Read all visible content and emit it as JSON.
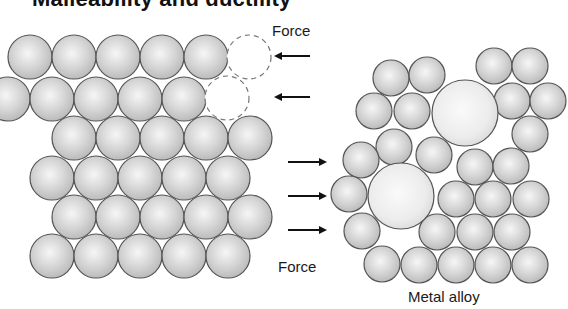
{
  "title": "Malleability and ductility",
  "labels": {
    "force_top": "Force",
    "force_bottom": "Force",
    "metal_alloy": "Metal  alloy"
  },
  "colors": {
    "sphere_outline": "#555555",
    "sphere_light": "#f4f4f4",
    "sphere_dark": "#b8b8b8",
    "arrow": "#111111"
  },
  "pure_metal": {
    "radius": 22,
    "atoms": [
      [
        30,
        57
      ],
      [
        74,
        57
      ],
      [
        118,
        57
      ],
      [
        162,
        57
      ],
      [
        206,
        57
      ],
      [
        8,
        99
      ],
      [
        52,
        99
      ],
      [
        96,
        99
      ],
      [
        140,
        99
      ],
      [
        184,
        99
      ],
      [
        74,
        138
      ],
      [
        118,
        138
      ],
      [
        162,
        138
      ],
      [
        206,
        138
      ],
      [
        250,
        138
      ],
      [
        52,
        178
      ],
      [
        96,
        178
      ],
      [
        140,
        178
      ],
      [
        184,
        178
      ],
      [
        228,
        178
      ],
      [
        74,
        217
      ],
      [
        118,
        217
      ],
      [
        162,
        217
      ],
      [
        206,
        217
      ],
      [
        250,
        217
      ],
      [
        52,
        256
      ],
      [
        96,
        256
      ],
      [
        140,
        256
      ],
      [
        184,
        256
      ],
      [
        228,
        256
      ]
    ],
    "displaced_atoms": [
      [
        249,
        57
      ],
      [
        227,
        98
      ]
    ]
  },
  "arrows": {
    "left": [
      [
        310,
        56,
        276
      ],
      [
        310,
        97,
        276
      ]
    ],
    "right": [
      [
        288,
        162,
        325
      ],
      [
        288,
        196,
        325
      ],
      [
        288,
        230,
        325
      ]
    ]
  },
  "alloy": {
    "small_radius": 18,
    "large_radius": 33,
    "large_atoms": [
      [
        465,
        113
      ],
      [
        401,
        196
      ]
    ],
    "small_atoms": [
      [
        391,
        78
      ],
      [
        427,
        75
      ],
      [
        374,
        111
      ],
      [
        412,
        111
      ],
      [
        394,
        147
      ],
      [
        494,
        66
      ],
      [
        530,
        66
      ],
      [
        512,
        101
      ],
      [
        548,
        101
      ],
      [
        530,
        134
      ],
      [
        361,
        160
      ],
      [
        349,
        194
      ],
      [
        362,
        231
      ],
      [
        434,
        155
      ],
      [
        475,
        167
      ],
      [
        511,
        166
      ],
      [
        456,
        199
      ],
      [
        493,
        199
      ],
      [
        531,
        199
      ],
      [
        437,
        232
      ],
      [
        475,
        232
      ],
      [
        512,
        232
      ],
      [
        382,
        264
      ],
      [
        419,
        265
      ],
      [
        456,
        265
      ],
      [
        493,
        265
      ],
      [
        530,
        265
      ]
    ]
  }
}
